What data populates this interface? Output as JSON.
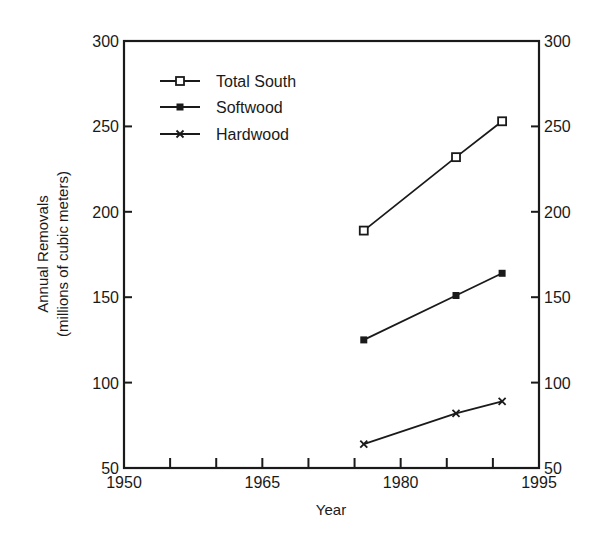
{
  "chart_data": {
    "type": "line",
    "title": "",
    "xlabel": "Year",
    "ylabel": "Annual Removals",
    "ylabel_sub": "(millions of cubic meters)",
    "xlim": [
      1950,
      1995
    ],
    "ylim": [
      50,
      300
    ],
    "x_ticks_major": [
      1950,
      1965,
      1980,
      1995
    ],
    "x_ticks_minor_step": 5,
    "y_ticks": [
      50,
      100,
      150,
      200,
      250,
      300
    ],
    "y_axis_mirrored_right": true,
    "grid": false,
    "legend_position": "upper-left",
    "x": [
      1976,
      1986,
      1991
    ],
    "series": [
      {
        "name": "Total South",
        "marker": "open-square",
        "values": [
          189,
          232,
          253
        ]
      },
      {
        "name": "Softwood",
        "marker": "filled-square",
        "values": [
          125,
          151,
          164
        ]
      },
      {
        "name": "Hardwood",
        "marker": "x",
        "values": [
          64,
          82,
          89
        ]
      }
    ]
  },
  "colors": {
    "ink": "#1a1a1a",
    "background": "#ffffff"
  }
}
